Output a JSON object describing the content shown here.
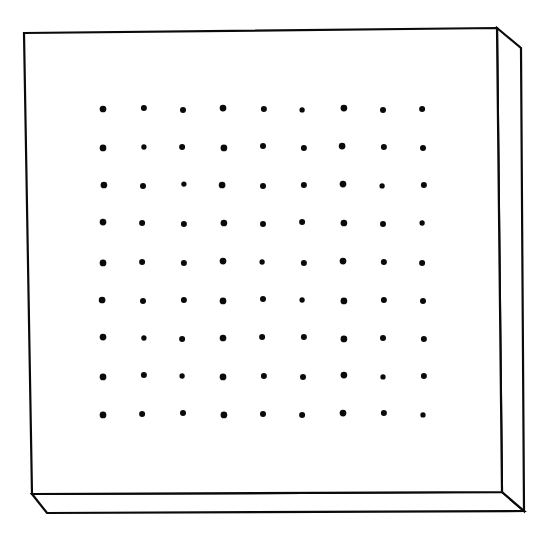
{
  "figure": {
    "style": {
      "background_color": "#ffffff",
      "line_color": "#0a0a0a",
      "line_width": 2.2,
      "dot_color": "#0a0a0a"
    },
    "body": {
      "name": "slab",
      "front_face": {
        "name": "front-face",
        "corners": {
          "top_left": [
            24,
            33
          ],
          "top_right": [
            497,
            28
          ],
          "bottom_right": [
            502,
            492
          ],
          "bottom_left": [
            32,
            494
          ]
        },
        "points": "24,33 497,28 502,492 32,494"
      },
      "right_face": {
        "name": "right-side-face",
        "corners": {
          "front_top": [
            497,
            28
          ],
          "back_top": [
            521,
            48
          ],
          "back_bottom": [
            524,
            511
          ],
          "front_bottom": [
            502,
            492
          ]
        },
        "points": "497,28 521,48 524,511 502,492"
      },
      "bottom_face": {
        "name": "bottom-face",
        "corners": {
          "front_left": [
            32,
            494
          ],
          "front_right": [
            502,
            492
          ],
          "back_right": [
            524,
            511
          ],
          "back_left": [
            47,
            513
          ]
        },
        "points": "32,494 502,492 524,511 47,513"
      }
    },
    "perforations": {
      "name": "dot-array",
      "rows": 9,
      "columns": 9,
      "count": 81,
      "dot_radius": 3.0,
      "origin": [
        103,
        109
      ],
      "column_spacing": 40.0,
      "row_spacing": 38.2,
      "column_x": [
        103,
        143,
        183,
        223,
        263,
        303,
        343,
        383,
        423
      ],
      "row_y": [
        109,
        147,
        185,
        223,
        262,
        300,
        338,
        376,
        414
      ],
      "jitter": [
        [
          0,
          0
        ],
        [
          1,
          -1
        ],
        [
          0,
          1
        ],
        [
          0,
          -1
        ],
        [
          1,
          0
        ],
        [
          -1,
          1
        ],
        [
          1,
          -1
        ],
        [
          0,
          1
        ],
        [
          -1,
          0
        ],
        [
          0,
          1
        ],
        [
          1,
          0
        ],
        [
          -1,
          0
        ],
        [
          1,
          1
        ],
        [
          0,
          -1
        ],
        [
          1,
          1
        ],
        [
          -1,
          -1
        ],
        [
          1,
          0
        ],
        [
          0,
          1
        ],
        [
          1,
          0
        ],
        [
          0,
          1
        ],
        [
          1,
          -1
        ],
        [
          -1,
          0
        ],
        [
          0,
          1
        ],
        [
          1,
          0
        ],
        [
          0,
          -1
        ],
        [
          -1,
          1
        ],
        [
          1,
          0
        ],
        [
          0,
          -1
        ],
        [
          -1,
          0
        ],
        [
          1,
          1
        ],
        [
          1,
          0
        ],
        [
          0,
          1
        ],
        [
          -1,
          -1
        ],
        [
          1,
          0
        ],
        [
          0,
          1
        ],
        [
          -1,
          0
        ],
        [
          0,
          1
        ],
        [
          -1,
          0
        ],
        [
          1,
          1
        ],
        [
          0,
          -1
        ],
        [
          -1,
          0
        ],
        [
          1,
          1
        ],
        [
          0,
          -1
        ],
        [
          1,
          0
        ],
        [
          -1,
          1
        ],
        [
          -1,
          0
        ],
        [
          0,
          1
        ],
        [
          1,
          0
        ],
        [
          0,
          1
        ],
        [
          0,
          -1
        ],
        [
          -1,
          0
        ],
        [
          1,
          1
        ],
        [
          1,
          0
        ],
        [
          0,
          1
        ],
        [
          0,
          -1
        ],
        [
          1,
          0
        ],
        [
          -1,
          1
        ],
        [
          0,
          0
        ],
        [
          -1,
          -1
        ],
        [
          1,
          -1
        ],
        [
          1,
          1
        ],
        [
          0,
          0
        ],
        [
          1,
          1
        ],
        [
          0,
          1
        ],
        [
          1,
          -1
        ],
        [
          -1,
          0
        ],
        [
          0,
          1
        ],
        [
          1,
          0
        ],
        [
          0,
          1
        ],
        [
          1,
          -1
        ],
        [
          0,
          1
        ],
        [
          1,
          0
        ],
        [
          0,
          1
        ],
        [
          -1,
          0
        ],
        [
          0,
          -1
        ],
        [
          1,
          1
        ],
        [
          0,
          0
        ],
        [
          -1,
          1
        ],
        [
          0,
          -1
        ],
        [
          1,
          -1
        ],
        [
          0,
          1
        ]
      ]
    }
  }
}
